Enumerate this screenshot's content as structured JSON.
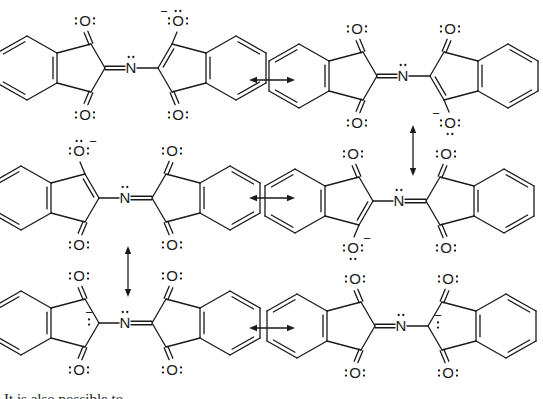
{
  "figure": {
    "atom_labels": {
      "oxygen": "O",
      "nitrogen": "N",
      "negative_charge": "−"
    },
    "structures": [
      {
        "id": "s1",
        "origin": [
          0,
          0
        ],
        "flip_left": false,
        "anion_site": "right-top-O",
        "double_to_N": "left"
      },
      {
        "id": "s2",
        "origin": [
          272,
          8
        ],
        "flip_left": false,
        "anion_site": "right-bottom-O",
        "double_to_N": "left"
      },
      {
        "id": "s3",
        "origin": [
          -6,
          130
        ],
        "flip_left": false,
        "anion_site": "left-top-O",
        "double_to_N": "right"
      },
      {
        "id": "s4",
        "origin": [
          268,
          133
        ],
        "flip_left": false,
        "anion_site": "left-bottom-O",
        "double_to_N": "right"
      },
      {
        "id": "s5",
        "origin": [
          -6,
          255
        ],
        "flip_left": false,
        "anion_site": "left-C2",
        "double_to_N": "right"
      },
      {
        "id": "s6",
        "origin": [
          270,
          258
        ],
        "flip_left": false,
        "anion_site": "right-C2",
        "double_to_N": "left"
      }
    ],
    "arrows": [
      {
        "id": "a1",
        "type": "double-headed",
        "from": [
          249,
          80
        ],
        "to": [
          295,
          80
        ]
      },
      {
        "id": "a2",
        "type": "double-headed",
        "from": [
          413,
          125
        ],
        "to": [
          413,
          176
        ]
      },
      {
        "id": "a3",
        "type": "double-headed",
        "from": [
          249,
          198
        ],
        "to": [
          295,
          198
        ]
      },
      {
        "id": "a4",
        "type": "double-headed",
        "from": [
          128,
          246
        ],
        "to": [
          128,
          297
        ]
      },
      {
        "id": "a5",
        "type": "double-headed",
        "from": [
          249,
          328
        ],
        "to": [
          295,
          328
        ]
      }
    ]
  },
  "caption": {
    "text": "It is also possible to"
  }
}
